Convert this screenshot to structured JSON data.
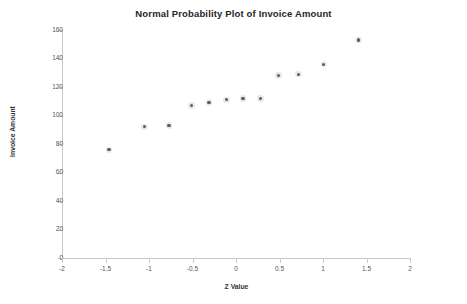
{
  "chart_data": {
    "type": "scatter",
    "title": "Normal Probability Plot of Invoice Amount",
    "xlabel": "Z Value",
    "ylabel": "Invoice Amount",
    "xlim": [
      -2,
      2
    ],
    "ylim": [
      0,
      160
    ],
    "xticks": [
      "-2",
      "-1.5",
      "-1",
      "-0.5",
      "0",
      "0.5",
      "1",
      "1.5",
      "2"
    ],
    "xtick_values": [
      -2,
      -1.5,
      -1,
      -0.5,
      0,
      0.5,
      1,
      1.5,
      2
    ],
    "yticks": [
      "0",
      "20",
      "40",
      "60",
      "80",
      "100",
      "120",
      "140",
      "160"
    ],
    "ytick_values": [
      0,
      20,
      40,
      60,
      80,
      100,
      120,
      140,
      160
    ],
    "grid": false,
    "legend": "none",
    "series": [
      {
        "name": "Invoice Amount",
        "marker": "dot",
        "color": "#595959",
        "points": [
          {
            "x": -1.46,
            "y": 76
          },
          {
            "x": -1.05,
            "y": 92
          },
          {
            "x": -0.77,
            "y": 93
          },
          {
            "x": -0.51,
            "y": 107
          },
          {
            "x": -0.31,
            "y": 109
          },
          {
            "x": -0.11,
            "y": 111
          },
          {
            "x": 0.08,
            "y": 112
          },
          {
            "x": 0.28,
            "y": 112
          },
          {
            "x": 0.49,
            "y": 128
          },
          {
            "x": 0.72,
            "y": 129
          },
          {
            "x": 1.01,
            "y": 136
          },
          {
            "x": 1.41,
            "y": 153
          }
        ]
      }
    ]
  },
  "colors": {
    "axis": "#c9c9c9",
    "tick_text": "#555555",
    "title_text": "#262626",
    "marker": "#595959",
    "background": "#ffffff"
  }
}
